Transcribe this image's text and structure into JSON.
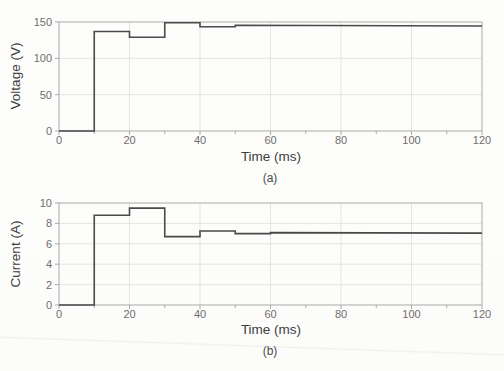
{
  "figure": {
    "background": "#fcfcfb",
    "colors": {
      "axis_box": "#a9a9a7",
      "grid": "#e4e4e1",
      "tick": "#a9a9a7",
      "tick_label": "#6e6e6e",
      "axis_title": "#3d3d3d",
      "line": "#4a4a4a"
    }
  },
  "chart_data": [
    {
      "type": "line",
      "subtype": "step",
      "title": "",
      "xlabel": "Time (ms)",
      "ylabel": "Voltage (V)",
      "caption": "(a)",
      "xlim": [
        0,
        120
      ],
      "ylim": [
        0,
        150
      ],
      "xticks": [
        0,
        20,
        40,
        60,
        80,
        100,
        120
      ],
      "xminor_step": 10,
      "yticks": [
        0,
        50,
        100,
        150
      ],
      "grid": true,
      "legend": null,
      "series": [
        {
          "name": "voltage",
          "x": [
            0,
            10,
            10,
            20,
            20,
            30,
            30,
            40,
            40,
            50,
            50,
            120
          ],
          "y": [
            0,
            0,
            137,
            137,
            129,
            129,
            149,
            149,
            143.5,
            143.5,
            145.5,
            144.5
          ]
        }
      ]
    },
    {
      "type": "line",
      "subtype": "step",
      "title": "",
      "xlabel": "Time (ms)",
      "ylabel": "Current (A)",
      "caption": "(b)",
      "xlim": [
        0,
        120
      ],
      "ylim": [
        0,
        10
      ],
      "xticks": [
        0,
        20,
        40,
        60,
        80,
        100,
        120
      ],
      "xminor_step": 10,
      "yticks": [
        0,
        2,
        4,
        6,
        8,
        10
      ],
      "grid": true,
      "legend": null,
      "series": [
        {
          "name": "current",
          "x": [
            0,
            10,
            10,
            20,
            20,
            30,
            30,
            40,
            40,
            50,
            50,
            60,
            60,
            120
          ],
          "y": [
            0,
            0,
            8.8,
            8.8,
            9.5,
            9.5,
            6.7,
            6.7,
            7.25,
            7.25,
            7.0,
            7.0,
            7.1,
            7.05
          ]
        }
      ]
    }
  ]
}
